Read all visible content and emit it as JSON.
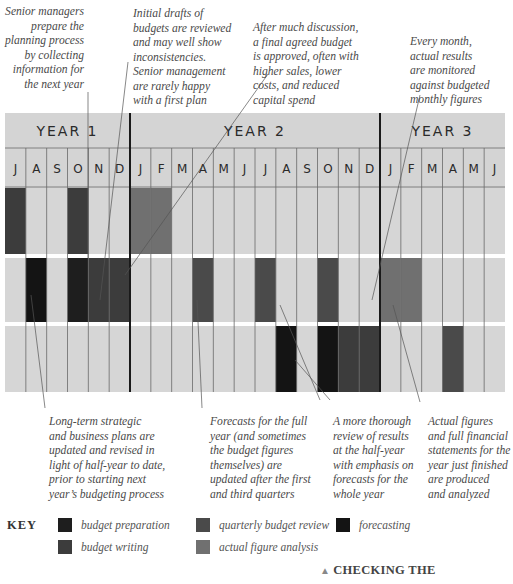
{
  "notes_top": [
    {
      "text": "Senior managers\nprepare the\nplanning process\nby collecting\ninformation for\nthe next year"
    },
    {
      "text": "Initial drafts of\nbudgets are reviewed\nand may well show\ninconsistencies.\nSenior management\nare rarely happy\nwith a first plan"
    },
    {
      "text": "After much discussion,\na final agreed budget\nis approved, often with\nhigher sales, lower\ncosts, and reduced\ncapital spend"
    },
    {
      "text": "Every month,\nactual results\nare monitored\nagainst budgeted\nmonthly figures"
    }
  ],
  "notes_bottom": [
    {
      "text": "Long-term strategic\nand business plans are\nupdated and revised in\nlight of half-year to date,\nprior to starting next\nyear’s budgeting process"
    },
    {
      "text": "Forecasts for the full\nyear (and sometimes\nthe budget figures\nthemselves) are\nupdated after the first\nand third quarters"
    },
    {
      "text": "A more thorough\nreview of results\nat the half-year\nwith emphasis on\nforecasts for the\nwhole year"
    },
    {
      "text": "Actual figures\nand full financial\nstatements for the\nyear just finished\nare produced\nand analyzed"
    }
  ],
  "chart_data": {
    "type": "timeline",
    "years": [
      {
        "label": "YEAR 1",
        "months": [
          "J",
          "A",
          "S",
          "O",
          "N",
          "D"
        ]
      },
      {
        "label": "YEAR 2",
        "months": [
          "J",
          "F",
          "M",
          "A",
          "M",
          "J",
          "J",
          "A",
          "S",
          "O",
          "N",
          "D"
        ]
      },
      {
        "label": "YEAR 3",
        "months": [
          "J",
          "F",
          "M",
          "A",
          "M",
          "J"
        ]
      }
    ],
    "categories": {
      "budget_preparation": {
        "label": "budget preparation",
        "color": "#1e1e1e"
      },
      "budget_writing": {
        "label": "budget writing",
        "color": "#3c3c3c"
      },
      "quarterly_budget_review": {
        "label": "quarterly budget review",
        "color": "#4a4a4a"
      },
      "actual_figure_analysis": {
        "label": "actual figure analysis",
        "color": "#707070"
      },
      "forecasting": {
        "label": "forecasting",
        "color": "#141414"
      }
    },
    "rows": [
      {
        "cells": [
          {
            "month_index": 0,
            "category": "budget_writing"
          },
          {
            "month_index": 3,
            "category": "budget_writing"
          },
          {
            "month_index": 6,
            "category": "actual_figure_analysis"
          },
          {
            "month_index": 7,
            "category": "actual_figure_analysis"
          }
        ]
      },
      {
        "cells": [
          {
            "month_index": 1,
            "category": "forecasting"
          },
          {
            "month_index": 3,
            "category": "budget_preparation"
          },
          {
            "month_index": 4,
            "category": "budget_writing"
          },
          {
            "month_index": 5,
            "category": "budget_writing"
          },
          {
            "month_index": 9,
            "category": "quarterly_budget_review"
          },
          {
            "month_index": 12,
            "category": "quarterly_budget_review"
          },
          {
            "month_index": 15,
            "category": "quarterly_budget_review"
          },
          {
            "month_index": 18,
            "category": "actual_figure_analysis"
          },
          {
            "month_index": 19,
            "category": "actual_figure_analysis"
          }
        ]
      },
      {
        "cells": [
          {
            "month_index": 13,
            "category": "forecasting"
          },
          {
            "month_index": 15,
            "category": "forecasting"
          },
          {
            "month_index": 16,
            "category": "budget_writing"
          },
          {
            "month_index": 17,
            "category": "budget_writing"
          },
          {
            "month_index": 21,
            "category": "quarterly_budget_review"
          }
        ]
      }
    ],
    "colors": {
      "header_bg": "#d4d4d4",
      "cell_bg": "#d6d6d6",
      "grid": "#6a6a6a",
      "year_divider": "#1a1a1a"
    }
  },
  "key": {
    "title": "KEY",
    "items": [
      {
        "category": "budget_preparation",
        "label": "budget preparation",
        "color": "#1e1e1e"
      },
      {
        "category": "budget_writing",
        "label": "budget writing",
        "color": "#3c3c3c"
      },
      {
        "category": "quarterly_budget_review",
        "label": "quarterly budget review",
        "color": "#4a4a4a"
      },
      {
        "category": "actual_figure_analysis",
        "label": "actual figure analysis",
        "color": "#707070"
      },
      {
        "category": "forecasting",
        "label": "forecasting",
        "color": "#141414"
      }
    ]
  },
  "caption": {
    "icon": "triangle-up-icon",
    "text": "CHECKING THE"
  }
}
